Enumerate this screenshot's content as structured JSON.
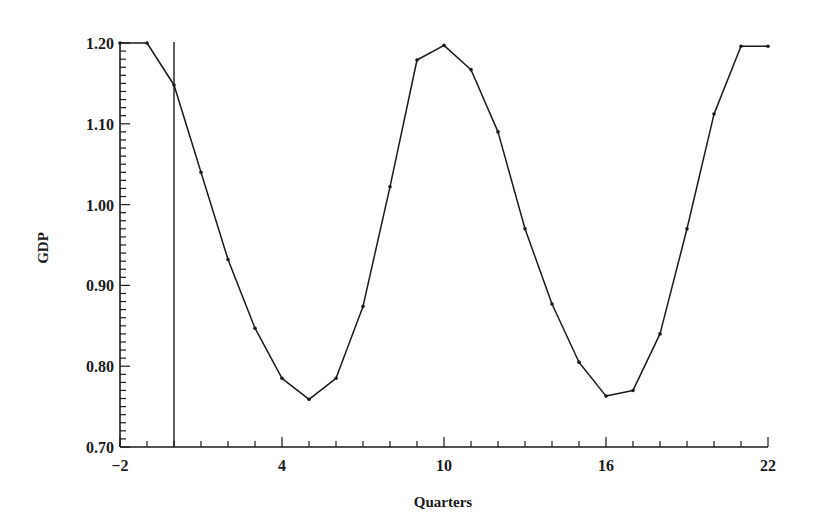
{
  "chart_data": {
    "type": "line",
    "title": "",
    "xlabel": "Quarters",
    "ylabel": "GDP",
    "xlim": [
      -2,
      22
    ],
    "ylim": [
      0.7,
      1.2
    ],
    "x_tick_labels": [
      "-2",
      "4",
      "10",
      "16",
      "22"
    ],
    "x_major_ticks": [
      -2,
      4,
      10,
      16,
      22
    ],
    "x_minor_step": 1,
    "y_tick_labels": [
      "0.70",
      "0.80",
      "0.90",
      "1.00",
      "1.10",
      "1.20"
    ],
    "y_major_ticks": [
      0.7,
      0.8,
      0.9,
      1.0,
      1.1,
      1.2
    ],
    "y_minor_step": 0.01,
    "grid": false,
    "legend": null,
    "vertical_reference_line": {
      "x": 0
    },
    "series": [
      {
        "name": "GDP",
        "x": [
          -2,
          -1,
          0,
          1,
          2,
          3,
          4,
          5,
          6,
          7,
          8,
          9,
          10,
          11,
          12,
          13,
          14,
          15,
          16,
          17,
          18,
          19,
          20,
          21,
          22
        ],
        "values": [
          1.2,
          1.2,
          1.148,
          1.04,
          0.932,
          0.847,
          0.785,
          0.759,
          0.785,
          0.874,
          1.022,
          1.179,
          1.197,
          1.167,
          1.09,
          0.97,
          0.877,
          0.805,
          0.763,
          0.77,
          0.84,
          0.97,
          1.112,
          1.196,
          1.196
        ]
      }
    ]
  },
  "colors": {
    "line": "#1a1a1a",
    "axis": "#1a1a1a",
    "background": "#ffffff"
  }
}
